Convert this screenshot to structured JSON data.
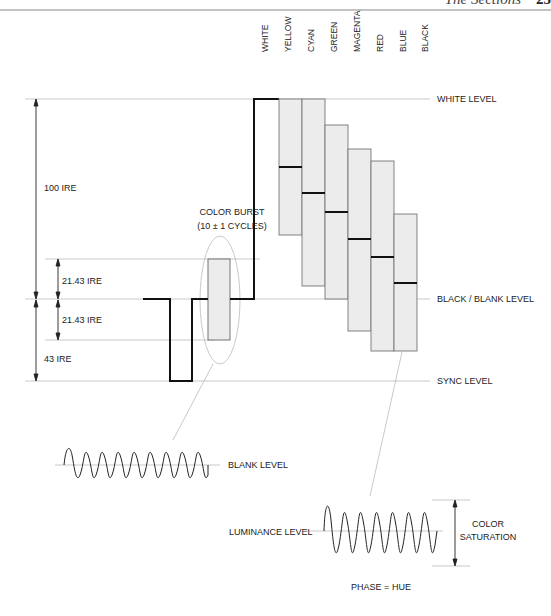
{
  "header": {
    "title": "The Sections",
    "page_number": "25"
  },
  "bar_labels": [
    "WHITE",
    "YELLOW",
    "CYAN",
    "GREEN",
    "MAGENTA",
    "RED",
    "BLUE",
    "BLACK"
  ],
  "levels": {
    "white": "WHITE LEVEL",
    "black_blank": "BLACK / BLANK LEVEL",
    "sync": "SYNC LEVEL"
  },
  "measurements": {
    "ire_100": "100 IRE",
    "ire_21_upper": "21.43 IRE",
    "ire_21_lower": "21.43 IRE",
    "ire_43": "43 IRE"
  },
  "color_burst": {
    "line1": "COLOR BURST",
    "line2": "(10 ± 1 CYCLES)"
  },
  "burst_detail": {
    "label": "BLANK LEVEL"
  },
  "chroma_detail": {
    "luminance_label": "LUMINANCE LEVEL",
    "saturation_line1": "COLOR",
    "saturation_line2": "SATURATION",
    "phase_label": "PHASE = HUE"
  },
  "colors": {
    "bar_fill": "#ececec",
    "bar_stroke": "#777777",
    "guide_line": "#bbbbbb",
    "signal": "#111111"
  }
}
